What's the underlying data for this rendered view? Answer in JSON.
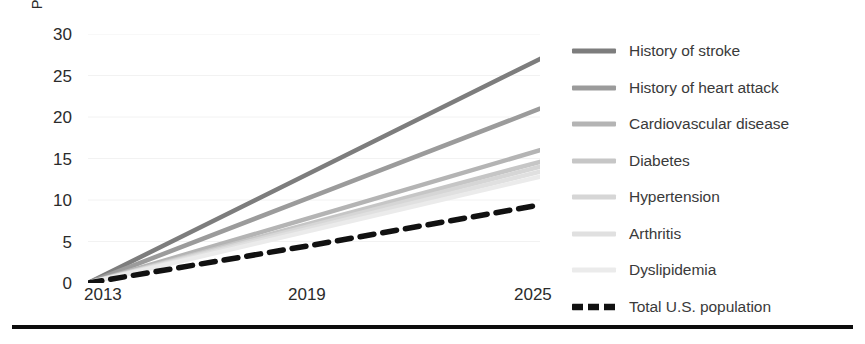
{
  "axes": {
    "ylabel": "Percent growth (Relative to 2013)",
    "yticks": [
      "30",
      "25",
      "20",
      "15",
      "10",
      "5",
      "0"
    ],
    "xticks": [
      "2013",
      "2019",
      "2025"
    ]
  },
  "legend": {
    "items": [
      {
        "label": "History of stroke",
        "color": "#7d7d7d",
        "style": "solid"
      },
      {
        "label": "History of heart attack",
        "color": "#9b9b9b",
        "style": "solid"
      },
      {
        "label": "Cardiovascular disease",
        "color": "#b4b4b4",
        "style": "solid"
      },
      {
        "label": "Diabetes",
        "color": "#c6c6c6",
        "style": "solid"
      },
      {
        "label": "Hypertension",
        "color": "#d6d6d6",
        "style": "solid"
      },
      {
        "label": "Arthritis",
        "color": "#e0e0e0",
        "style": "solid"
      },
      {
        "label": "Dyslipidemia",
        "color": "#ebebeb",
        "style": "solid"
      },
      {
        "label": "Total U.S. population",
        "color": "#111111",
        "style": "dashed"
      }
    ]
  },
  "chart_data": {
    "type": "line",
    "title": "",
    "xlabel": "",
    "ylabel": "Percent growth (Relative to 2013)",
    "x": [
      2013,
      2019,
      2025
    ],
    "xlim": [
      2013,
      2025
    ],
    "ylim": [
      0,
      30
    ],
    "ytick_values": [
      0,
      5,
      10,
      15,
      20,
      25,
      30
    ],
    "xtick_values": [
      2013,
      2019,
      2025
    ],
    "grid": "faint-horizontal",
    "legend_position": "right",
    "series": [
      {
        "name": "History of stroke",
        "values": [
          0,
          13.5,
          27.0
        ],
        "color": "#7d7d7d",
        "style": "solid"
      },
      {
        "name": "History of heart attack",
        "values": [
          0,
          10.5,
          21.0
        ],
        "color": "#9b9b9b",
        "style": "solid"
      },
      {
        "name": "Cardiovascular disease",
        "values": [
          0,
          8.0,
          16.0
        ],
        "color": "#b4b4b4",
        "style": "solid"
      },
      {
        "name": "Diabetes",
        "values": [
          0,
          7.3,
          14.6
        ],
        "color": "#c6c6c6",
        "style": "solid"
      },
      {
        "name": "Hypertension",
        "values": [
          0,
          7.0,
          14.0
        ],
        "color": "#d6d6d6",
        "style": "solid"
      },
      {
        "name": "Arthritis",
        "values": [
          0,
          6.7,
          13.4
        ],
        "color": "#e0e0e0",
        "style": "solid"
      },
      {
        "name": "Dyslipidemia",
        "values": [
          0,
          6.4,
          12.8
        ],
        "color": "#ebebeb",
        "style": "solid"
      },
      {
        "name": "Total U.S. population",
        "values": [
          0,
          4.6,
          9.4
        ],
        "color": "#111111",
        "style": "dashed"
      }
    ]
  }
}
